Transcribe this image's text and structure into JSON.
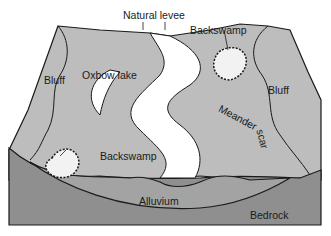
{
  "diagram": {
    "colors": {
      "surface": "#bdbdbd",
      "cross_section": "#8f8f8f",
      "alluvium": "#9c9c9c",
      "river": "#ffffff",
      "outline": "#1a1a1a"
    },
    "labels": {
      "natural_levee": "Natural levee",
      "backswamp_top": "Backswamp",
      "bluff_left": "Bluff",
      "bluff_right": "Bluff",
      "oxbow_lake": "Oxbow lake",
      "meander": "Meander",
      "scar": "scar",
      "backswamp_bottom": "Backswamp",
      "alluvium": "Alluvium",
      "bedrock": "Bedrock"
    }
  }
}
